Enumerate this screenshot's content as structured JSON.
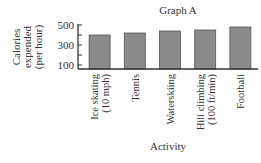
{
  "chart_data": {
    "type": "bar",
    "title": "Graph A",
    "xlabel": "Activity",
    "ylabel_lines": [
      "Calories",
      "expended",
      "(per hour)"
    ],
    "ylabel": "Calories expended (per hour)",
    "categories": [
      "Ice skating (10 mph)",
      "Tennis",
      "Waterskiing",
      "Hill climbing (100 ft/min)",
      "Football"
    ],
    "category_lines": [
      [
        "Ice skating",
        "(10 mph)"
      ],
      [
        "Tennis"
      ],
      [
        "Waterskiing"
      ],
      [
        "Hill climbing",
        "(100 ft/min)"
      ],
      [
        "Football"
      ]
    ],
    "values": [
      400,
      420,
      440,
      450,
      480
    ],
    "yticks": [
      100,
      300,
      500
    ],
    "ylim": [
      60,
      500
    ],
    "grid": false,
    "bar_color": "#8a8a8a",
    "bar_edge_color": "#555555",
    "axis_color": "#333333"
  }
}
